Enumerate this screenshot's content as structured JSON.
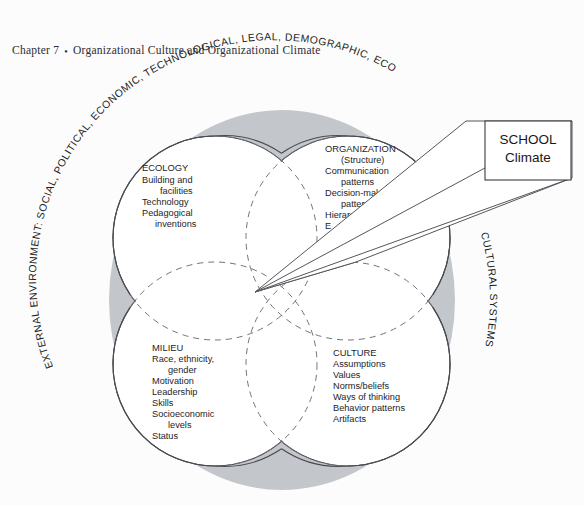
{
  "page": {
    "background_color": "#fcfcfc",
    "header": {
      "chapter": "Chapter 7",
      "separator": "•",
      "title": "Organizational Culture and Organizational Climate"
    }
  },
  "figure": {
    "type": "venn-diagram",
    "colors": {
      "ring_fill": "#c3c7cb",
      "circle_stroke": "#4a4a52",
      "dashed_stroke": "#6e6e78",
      "text": "#242428",
      "prism_fill": "#ffffff",
      "prism_stroke": "#55555c",
      "box_fill": "#ffffff",
      "box_stroke": "#3a3a42"
    },
    "outer_ring_label_left": "EXTERNAL ENVIRONMENT: SOCIAL, POLITICAL, ECONOMIC, TECHNOLOGICAL, LEGAL, DEMOGRAPHIC, ECO",
    "outer_ring_label_right": "CULTURAL SYSTEMS",
    "callout_box": {
      "line1": "SCHOOL",
      "line2": "Climate"
    },
    "quadrants": [
      {
        "id": "ecology",
        "title": "ECOLOGY",
        "items": [
          "Building and",
          "facilities",
          "Technology",
          "Pedagogical",
          "inventions"
        ],
        "indent": [
          false,
          true,
          false,
          false,
          true
        ]
      },
      {
        "id": "organization",
        "title": "ORGANIZATION",
        "items": [
          "(Structure)",
          "Communication",
          "patterns",
          "Decision-making",
          "patterns",
          "Hierarchy",
          "E"
        ],
        "indent": [
          true,
          false,
          true,
          false,
          true,
          false,
          false
        ]
      },
      {
        "id": "milieu",
        "title": "MILIEU",
        "items": [
          "Race, ethnicity,",
          "gender",
          "Motivation",
          "Leadership",
          "Skills",
          "Socioeconomic",
          "levels",
          "Status"
        ],
        "indent": [
          false,
          true,
          false,
          false,
          false,
          false,
          true,
          false
        ]
      },
      {
        "id": "culture",
        "title": "CULTURE",
        "items": [
          "Assumptions",
          "Values",
          "Norms/beliefs",
          "Ways of thinking",
          "Behavior patterns",
          "Artifacts"
        ],
        "indent": [
          false,
          false,
          false,
          false,
          false,
          false
        ]
      }
    ]
  }
}
